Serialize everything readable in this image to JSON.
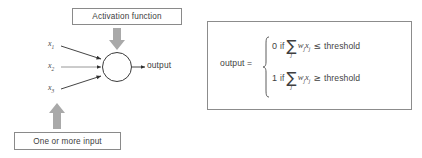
{
  "figure": {
    "background": "#ffffff",
    "line_color": "#3a3a3a",
    "box_border_color": "#8a8a8a",
    "block_arrow_color": "#a9a9a9",
    "text_color": "#3d3d3d"
  },
  "diagram": {
    "activation_box_label": "Activation function",
    "input_box_label": "One or more input",
    "output_label": "output",
    "inputs": [
      {
        "base": "x",
        "sub": "1"
      },
      {
        "base": "x",
        "sub": "2"
      },
      {
        "base": "x",
        "sub": "3"
      }
    ],
    "neuron_shape": "circle",
    "arrows": {
      "activation_block_arrow": "down-block-arrow",
      "input_block_arrow": "up-block-arrow",
      "signal_arrows": "3 incoming, 1 outgoing"
    }
  },
  "formula": {
    "lhs": "output =",
    "brace": "left-curly-brace",
    "cases": [
      {
        "value": "0",
        "keyword": "if",
        "sum_symbol": "∑",
        "sum_subscript": "j",
        "term_w": "w",
        "term_w_sub": "j",
        "term_x": "x",
        "term_x_sub": "j",
        "relation": "≤",
        "threshold": "threshold"
      },
      {
        "value": "1",
        "keyword": "if",
        "sum_symbol": "∑",
        "sum_subscript": "j",
        "term_w": "w",
        "term_w_sub": "j",
        "term_x": "x",
        "term_x_sub": "j",
        "relation": "≥",
        "threshold": "threshold"
      }
    ]
  }
}
